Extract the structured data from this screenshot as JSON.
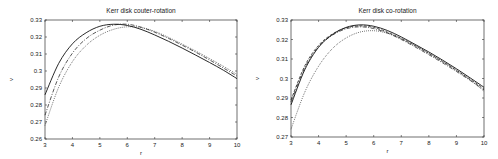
{
  "chart_data": [
    {
      "type": "line",
      "title": "Kerr disk couter-rotation",
      "xlabel": "r",
      "ylabel": "v",
      "xlim": [
        3,
        10
      ],
      "ylim": [
        0.26,
        0.33
      ],
      "xticks": [
        "3",
        "4",
        "5",
        "6",
        "7",
        "8",
        "9",
        "10"
      ],
      "yticks": [
        "0.26",
        "0.27",
        "0.28",
        "0.29",
        "0.3",
        "0.31",
        "0.32",
        "0.33"
      ],
      "grid": false,
      "legend": null,
      "x": [
        3,
        3.5,
        4,
        4.5,
        5,
        5.5,
        6,
        6.5,
        7,
        7.5,
        8,
        8.5,
        9,
        9.5,
        10
      ],
      "series": [
        {
          "name": "solid",
          "style": "solid",
          "values": [
            0.286,
            0.3045,
            0.316,
            0.3225,
            0.3263,
            0.3275,
            0.3268,
            0.3245,
            0.3212,
            0.3175,
            0.3135,
            0.3093,
            0.305,
            0.3005,
            0.2955
          ]
        },
        {
          "name": "dash-dot",
          "style": "dashdot",
          "values": [
            0.274,
            0.2965,
            0.3105,
            0.319,
            0.324,
            0.327,
            0.3275,
            0.3258,
            0.3228,
            0.3192,
            0.3152,
            0.311,
            0.3065,
            0.3018,
            0.297
          ]
        },
        {
          "name": "dotted",
          "style": "dotted",
          "values": [
            0.268,
            0.2905,
            0.3055,
            0.315,
            0.321,
            0.3245,
            0.326,
            0.3255,
            0.3233,
            0.3198,
            0.3158,
            0.3117,
            0.3073,
            0.3028,
            0.298
          ]
        }
      ]
    },
    {
      "type": "line",
      "title": "Kerr disk co-rotation",
      "xlabel": "r",
      "ylabel": "v",
      "xlim": [
        3,
        10
      ],
      "ylim": [
        0.27,
        0.33
      ],
      "xticks": [
        "3",
        "4",
        "5",
        "6",
        "7",
        "8",
        "9",
        "10"
      ],
      "yticks": [
        "0.27",
        "0.28",
        "0.29",
        "0.3",
        "0.31",
        "0.32",
        "0.33"
      ],
      "grid": false,
      "legend": null,
      "x": [
        3,
        3.5,
        4,
        4.5,
        5,
        5.5,
        6,
        6.5,
        7,
        7.5,
        8,
        8.5,
        9,
        9.5,
        10
      ],
      "series": [
        {
          "name": "solid",
          "style": "solid",
          "values": [
            0.2865,
            0.3045,
            0.316,
            0.3225,
            0.3262,
            0.3275,
            0.3268,
            0.3246,
            0.3213,
            0.3175,
            0.3136,
            0.3094,
            0.305,
            0.3003,
            0.2955
          ]
        },
        {
          "name": "dashed",
          "style": "dashed",
          "values": [
            0.289,
            0.3065,
            0.317,
            0.3228,
            0.326,
            0.327,
            0.3262,
            0.3238,
            0.3205,
            0.3168,
            0.3128,
            0.3086,
            0.3042,
            0.2996,
            0.2948
          ]
        },
        {
          "name": "dash-dot",
          "style": "dashdot",
          "values": [
            0.288,
            0.3055,
            0.3163,
            0.3222,
            0.3255,
            0.3265,
            0.3256,
            0.3233,
            0.32,
            0.3162,
            0.3122,
            0.308,
            0.3036,
            0.299,
            0.2942
          ]
        },
        {
          "name": "dotted",
          "style": "dotted",
          "values": [
            0.274,
            0.293,
            0.3063,
            0.3153,
            0.3208,
            0.3238,
            0.3245,
            0.3232,
            0.3205,
            0.317,
            0.313,
            0.3088,
            0.3043,
            0.2992,
            0.2935
          ]
        }
      ]
    }
  ]
}
